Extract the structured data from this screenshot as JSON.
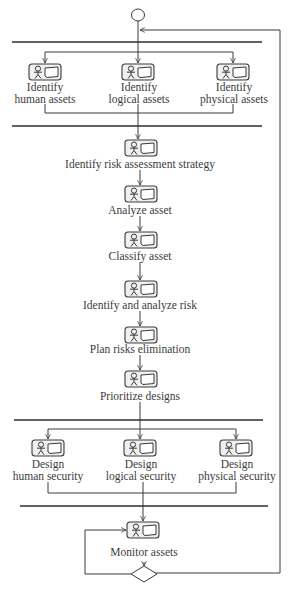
{
  "diagram": {
    "type": "UML activity diagram",
    "stroke_color": "#3a3a3a",
    "bar_color": "#2e2e2e",
    "start_node": "initial-node",
    "group1": {
      "activities": [
        {
          "line1": "Identify",
          "line2": "human assets"
        },
        {
          "line1": "Identify",
          "line2": "logical assets"
        },
        {
          "line1": "Identify",
          "line2": "physical assets"
        }
      ]
    },
    "sequence": [
      {
        "label": "Identify risk assessment strategy"
      },
      {
        "label": "Analyze asset"
      },
      {
        "label": "Classify asset"
      },
      {
        "label": "Identify and analyze risk"
      },
      {
        "label": "Plan risks elimination"
      },
      {
        "label": "Prioritize designs"
      }
    ],
    "group2": {
      "activities": [
        {
          "line1": "Design",
          "line2": "human security"
        },
        {
          "line1": "Design",
          "line2": "logical security"
        },
        {
          "line1": "Design",
          "line2": "physical security"
        }
      ]
    },
    "final": {
      "label": "Monitor assets"
    },
    "decision_node": "diamond"
  }
}
